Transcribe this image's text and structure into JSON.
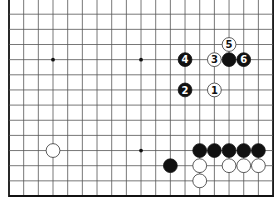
{
  "diagram": {
    "type": "go-board-partial",
    "columns": 19,
    "visible_rows": 13,
    "edges": {
      "left": true,
      "right": true,
      "bottom": true,
      "top": false
    },
    "colors": {
      "line": "#555555",
      "edge": "#111111",
      "black": "#111111",
      "white": "#ffffff",
      "background": "#ffffff"
    },
    "star_points": [
      {
        "col": 3,
        "row": 3
      },
      {
        "col": 9,
        "row": 3
      },
      {
        "col": 9,
        "row": 9
      }
    ],
    "stones": [
      {
        "col": 14,
        "row": 5,
        "color": "white",
        "label": "1"
      },
      {
        "col": 12,
        "row": 5,
        "color": "black",
        "label": "2"
      },
      {
        "col": 14,
        "row": 3,
        "color": "white",
        "label": "3"
      },
      {
        "col": 12,
        "row": 3,
        "color": "black",
        "label": "4"
      },
      {
        "col": 15,
        "row": 2,
        "color": "white",
        "label": "5"
      },
      {
        "col": 16,
        "row": 3,
        "color": "black",
        "label": "6"
      },
      {
        "col": 15,
        "row": 3,
        "color": "black",
        "label": ""
      },
      {
        "col": 3,
        "row": 9,
        "color": "white",
        "label": ""
      },
      {
        "col": 13,
        "row": 9,
        "color": "black",
        "label": ""
      },
      {
        "col": 14,
        "row": 9,
        "color": "black",
        "label": ""
      },
      {
        "col": 15,
        "row": 9,
        "color": "black",
        "label": ""
      },
      {
        "col": 16,
        "row": 9,
        "color": "black",
        "label": ""
      },
      {
        "col": 17,
        "row": 9,
        "color": "black",
        "label": ""
      },
      {
        "col": 11,
        "row": 10,
        "color": "black",
        "label": ""
      },
      {
        "col": 13,
        "row": 10,
        "color": "white",
        "label": ""
      },
      {
        "col": 15,
        "row": 10,
        "color": "white",
        "label": ""
      },
      {
        "col": 16,
        "row": 10,
        "color": "white",
        "label": ""
      },
      {
        "col": 17,
        "row": 10,
        "color": "white",
        "label": ""
      },
      {
        "col": 13,
        "row": 11,
        "color": "white",
        "label": ""
      }
    ]
  }
}
